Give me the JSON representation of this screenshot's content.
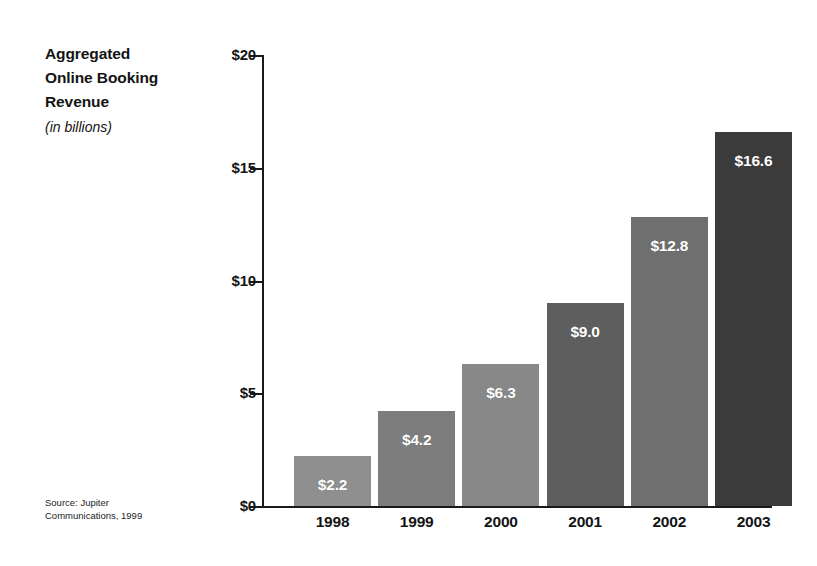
{
  "chart_data": {
    "type": "bar",
    "title": "Aggregated Online Booking Revenue",
    "title_lines": [
      "Aggregated",
      "Online Booking",
      "Revenue"
    ],
    "subtitle": "(in billions)",
    "xlabel": "",
    "ylabel": "",
    "categories": [
      "1998",
      "1999",
      "2000",
      "2001",
      "2002",
      "2003"
    ],
    "values": [
      2.2,
      4.2,
      6.3,
      9.0,
      12.8,
      16.6
    ],
    "value_labels": [
      "$2.2",
      "$4.2",
      "$6.3",
      "$9.0",
      "$12.8",
      "$16.6"
    ],
    "ylim": [
      0,
      20
    ],
    "y_ticks": [
      0,
      5,
      10,
      15,
      20
    ],
    "y_tick_labels": [
      "$0",
      "$5",
      "$10",
      "$15",
      "$20"
    ],
    "grid": false,
    "legend": null,
    "bar_colors": [
      "#8f8f8f",
      "#7d7d7d",
      "#888888",
      "#5e5e5e",
      "#6f6f6f",
      "#3b3b3b"
    ],
    "axis_color": "#1a1a1a",
    "value_label_color": "#ffffff",
    "background_color": "#ffffff",
    "source": {
      "lines": [
        "Source: Jupiter",
        "Communications, 1999"
      ]
    }
  }
}
